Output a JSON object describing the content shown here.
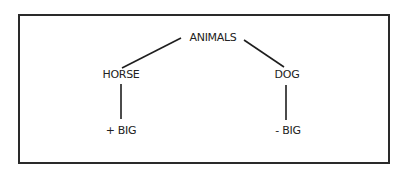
{
  "diagram": {
    "type": "tree",
    "nodes": [
      {
        "id": "animals",
        "label": "ANIMALS"
      },
      {
        "id": "horse",
        "label": "HORSE"
      },
      {
        "id": "dog",
        "label": "DOG"
      },
      {
        "id": "horse_feature",
        "label": "+ BIG"
      },
      {
        "id": "dog_feature",
        "label": "- BIG"
      }
    ],
    "edges": [
      {
        "from": "animals",
        "to": "horse"
      },
      {
        "from": "animals",
        "to": "dog"
      },
      {
        "from": "horse",
        "to": "horse_feature"
      },
      {
        "from": "dog",
        "to": "dog_feature"
      }
    ],
    "colors": {
      "line": "#1e1e1e",
      "text": "#222222",
      "border": "#2a2a2a"
    }
  }
}
